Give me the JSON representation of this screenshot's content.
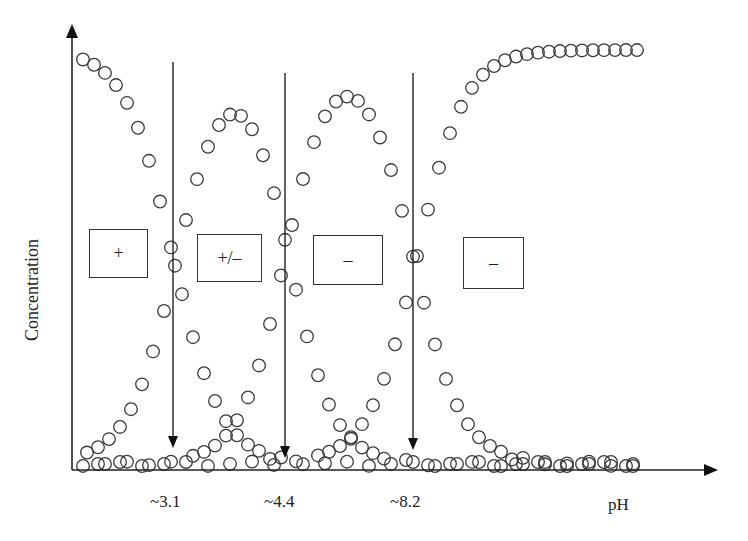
{
  "chart_data": {
    "type": "scatter",
    "title": "",
    "xlabel": "pH",
    "ylabel": "Concentration",
    "grid": false,
    "legend": "none (species labelled by boxed charge signs)",
    "axis_ticks_shown": false,
    "x_annotations": [
      {
        "label": "~3.1",
        "pH": 3.1
      },
      {
        "label": "~4.4",
        "pH": 4.4
      },
      {
        "label": "~8.2",
        "pH": 8.2
      }
    ],
    "species_labels": [
      {
        "label": "+",
        "region": "below pH 3.1"
      },
      {
        "label": "+/–",
        "region": "between pH 3.1 and 4.4"
      },
      {
        "label": "–",
        "region": "between pH 4.4 and 8.2"
      },
      {
        "label": "–",
        "region": "above pH 8.2"
      }
    ],
    "series": [
      {
        "name": "+ (cationic)",
        "shape": "sigmoid decreasing",
        "max": 1.0,
        "midpoint_pH": 3.1
      },
      {
        "name": "+/– (zwitterion)",
        "shape": "bell",
        "peak": 0.88,
        "peak_between": [
          3.1,
          4.4
        ]
      },
      {
        "name": "– (anion)",
        "shape": "bell",
        "peak": 0.86,
        "peak_between": [
          4.4,
          8.2
        ]
      },
      {
        "name": "– (dianion)",
        "shape": "sigmoid increasing",
        "max": 1.0,
        "midpoint_pH": 8.2
      }
    ]
  },
  "axes": {
    "y_label": "Concentration",
    "x_label": "pH"
  },
  "annotations": {
    "pka1": "~3.1",
    "pka2": "~4.4",
    "pka3": "~8.2"
  },
  "boxes": {
    "cation": "+",
    "zwitterion": "+/–",
    "anion": "–",
    "dianion": "–"
  },
  "style": {
    "marker_stroke": "#3a3a3a",
    "axis_color": "#222222"
  }
}
